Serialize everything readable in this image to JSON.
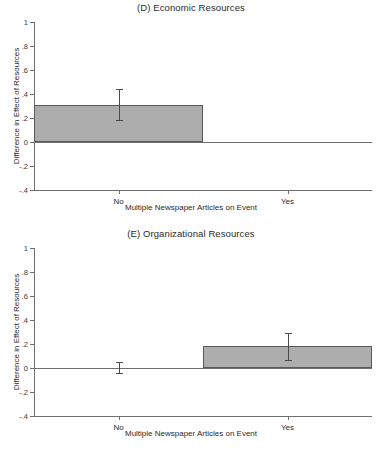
{
  "figure": {
    "background": "#ffffff",
    "bar_fill": "#adadad",
    "bar_border": "#5a5a5a",
    "axis_color": "#6f6f6f"
  },
  "chart_data": [
    {
      "type": "bar",
      "title": "(D) Economic Resources",
      "panel_letter": "(D)",
      "xlabel": "Multiple Newspaper Articles on Event",
      "ylabel": "Difference in Effect of Resources",
      "categories": [
        "No",
        "Yes"
      ],
      "values": [
        0.31,
        0.0
      ],
      "errors_low": [
        0.18,
        0.0
      ],
      "errors_high": [
        0.44,
        0.0
      ],
      "ylim": [
        -0.4,
        1.0
      ],
      "yticks": [
        1,
        0.8,
        0.6,
        0.4,
        0.2,
        0,
        -0.2,
        -0.4
      ],
      "ytick_labels": [
        "1",
        ".8",
        ".6",
        ".4",
        ".2",
        "0",
        "-.2",
        "-.4"
      ],
      "grid": false,
      "legend": false
    },
    {
      "type": "bar",
      "title": "(E) Organizational Resources",
      "panel_letter": "(E)",
      "xlabel": "Multiple Newspaper Articles on Event",
      "ylabel": "Difference in Effect of Resources",
      "categories": [
        "No",
        "Yes"
      ],
      "values": [
        0.005,
        0.18
      ],
      "errors_low": [
        -0.04,
        0.07
      ],
      "errors_high": [
        0.05,
        0.29
      ],
      "ylim": [
        -0.4,
        1.0
      ],
      "yticks": [
        1,
        0.8,
        0.6,
        0.4,
        0.2,
        0,
        -0.2,
        -0.4
      ],
      "ytick_labels": [
        "1",
        ".8",
        ".6",
        ".4",
        ".2",
        "0",
        "-.2",
        "-.4"
      ],
      "grid": false,
      "legend": false
    }
  ]
}
